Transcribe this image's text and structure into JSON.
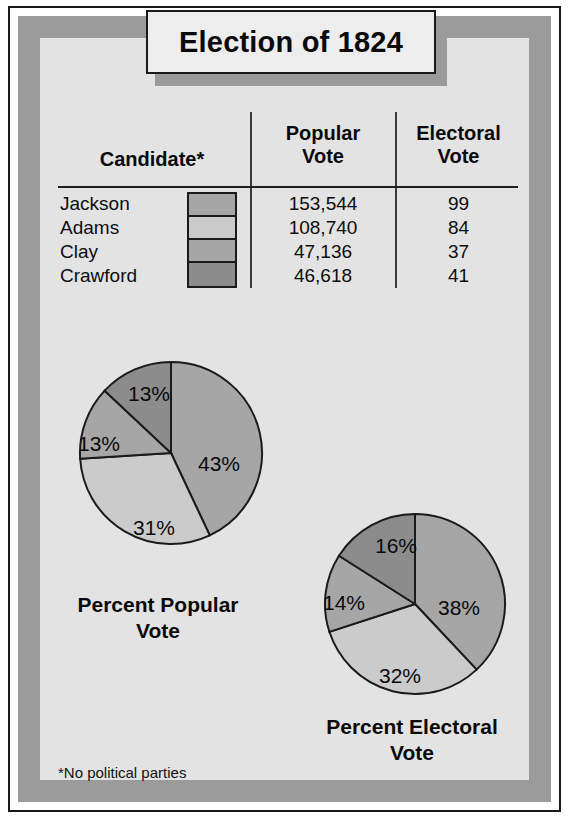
{
  "figure": {
    "title": "Election of 1824",
    "footnote": "*No political parties"
  },
  "table": {
    "headers": {
      "candidate": "Candidate*",
      "popular": "Popular\nVote",
      "popular_line1": "Popular",
      "popular_line2": "Vote",
      "electoral_line1": "Electoral",
      "electoral_line2": "Vote"
    },
    "rows": [
      {
        "candidate": "Jackson",
        "popular_vote": "153,544",
        "electoral_vote": "99",
        "swatch": "#a6a6a6"
      },
      {
        "candidate": "Adams",
        "popular_vote": "108,740",
        "electoral_vote": "84",
        "swatch": "#cbcbcb"
      },
      {
        "candidate": "Clay",
        "popular_vote": "47,136",
        "electoral_vote": "37",
        "swatch": "#a6a6a6"
      },
      {
        "candidate": "Crawford",
        "popular_vote": "46,618",
        "electoral_vote": "41",
        "swatch": "#8c8c8c"
      }
    ]
  },
  "charts": {
    "popular": {
      "caption_line1": "Percent Popular",
      "caption_line2": "Vote",
      "labels": {
        "jackson": "43%",
        "adams": "31%",
        "clay": "13%",
        "crawford": "13%"
      }
    },
    "electoral": {
      "caption_line1": "Percent Electoral",
      "caption_line2": "Vote",
      "labels": {
        "jackson": "38%",
        "adams": "32%",
        "clay": "14%",
        "crawford": "16%"
      }
    }
  },
  "colors": {
    "jackson": "#a6a6a6",
    "adams": "#cbcbcb",
    "clay": "#a6a6a6",
    "crawford": "#8c8c8c",
    "background": "#e3e3e3",
    "frame_band": "#9b9b9b",
    "ink": "#1a1a1a"
  },
  "chart_data": [
    {
      "type": "pie",
      "title": "Percent Popular Vote",
      "categories": [
        "Jackson",
        "Adams",
        "Clay",
        "Crawford"
      ],
      "values": [
        43,
        31,
        13,
        13
      ],
      "unit": "percent",
      "data_labels": [
        "43%",
        "31%",
        "13%",
        "13%"
      ],
      "slice_colors": [
        "#a6a6a6",
        "#cbcbcb",
        "#a6a6a6",
        "#8c8c8c"
      ],
      "start_angle_deg": 0,
      "direction": "clockwise",
      "legend": "swatch column in table",
      "grid": false
    },
    {
      "type": "pie",
      "title": "Percent Electoral Vote",
      "categories": [
        "Jackson",
        "Adams",
        "Clay",
        "Crawford"
      ],
      "values": [
        38,
        32,
        14,
        16
      ],
      "unit": "percent",
      "data_labels": [
        "38%",
        "32%",
        "14%",
        "16%"
      ],
      "slice_colors": [
        "#a6a6a6",
        "#cbcbcb",
        "#a6a6a6",
        "#8c8c8c"
      ],
      "start_angle_deg": 0,
      "direction": "clockwise",
      "legend": "swatch column in table",
      "grid": false
    },
    {
      "type": "table",
      "title": "Election of 1824",
      "columns": [
        "Candidate*",
        "Popular Vote",
        "Electoral Vote"
      ],
      "rows": [
        [
          "Jackson",
          "153,544",
          "99"
        ],
        [
          "Adams",
          "108,740",
          "84"
        ],
        [
          "Clay",
          "47,136",
          "37"
        ],
        [
          "Crawford",
          "46,618",
          "41"
        ]
      ]
    }
  ]
}
